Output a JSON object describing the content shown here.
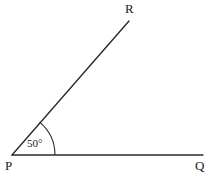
{
  "figure": {
    "type": "angle-diagram",
    "background_color": "#ffffff",
    "stroke_color": "#2b2b2b",
    "text_color": "#1a1a1a",
    "width": 216,
    "height": 176
  },
  "vertices": {
    "P": {
      "label": "P",
      "x": 12,
      "y": 155,
      "role": "angle-vertex"
    },
    "Q": {
      "label": "Q",
      "x": 203,
      "y": 155,
      "role": "ray-endpoint"
    },
    "R": {
      "label": "R",
      "x": 129,
      "y": 21,
      "role": "ray-endpoint"
    }
  },
  "rays": [
    {
      "name": "ray-PQ",
      "from": "P",
      "to": "Q",
      "x1": 12,
      "y1": 155,
      "x2": 203,
      "y2": 155
    },
    {
      "name": "ray-PR",
      "from": "P",
      "to": "R",
      "x1": 12,
      "y1": 155,
      "x2": 129,
      "y2": 21
    }
  ],
  "angle": {
    "name": "angle-RPQ",
    "value": 50,
    "unit": "degrees",
    "label": "50°",
    "arc_radius": 43,
    "arc_start_x": 55,
    "arc_start_y": 155,
    "arc_end_x": 40,
    "arc_end_y": 123
  }
}
